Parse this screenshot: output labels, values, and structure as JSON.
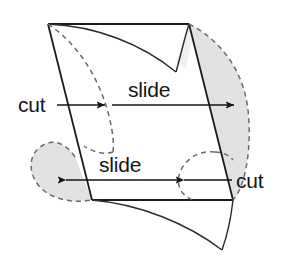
{
  "figure": {
    "background_color": "#ffffff",
    "stroke_color": "#1a1a1a",
    "dashed_stroke_color": "#6a6a6a",
    "shaded_fill_color": "#e2e2e2",
    "text_color": "#151515"
  },
  "labels": {
    "cut_left": "cut",
    "slide_top": "slide",
    "slide_bottom": "slide",
    "cut_right": "cut"
  },
  "annotations": [
    {
      "name": "cut-left",
      "text": "cut",
      "arrow": "right",
      "x": 18,
      "y": 112
    },
    {
      "name": "slide-top",
      "text": "slide",
      "arrow": "right",
      "x": 128,
      "y": 96
    },
    {
      "name": "slide-bottom",
      "text": "slide",
      "arrow": "left",
      "x": 99,
      "y": 172
    },
    {
      "name": "cut-right",
      "text": "cut",
      "arrow": "left",
      "x": 236,
      "y": 187
    }
  ],
  "geometry": {
    "parallelogram": {
      "top_left": [
        48,
        24
      ],
      "top_right": [
        189,
        24
      ],
      "bottom_right": [
        233,
        200
      ],
      "bottom_left": [
        92,
        200
      ]
    },
    "shaded_regions": [
      {
        "name": "right-crescent",
        "description": "lens between right edge and dashed arc bulging right"
      },
      {
        "name": "left-lens",
        "description": "rounded region left of left edge bounded by dashed arc"
      }
    ],
    "dashed_arcs": 4,
    "solid_curves": 2
  }
}
